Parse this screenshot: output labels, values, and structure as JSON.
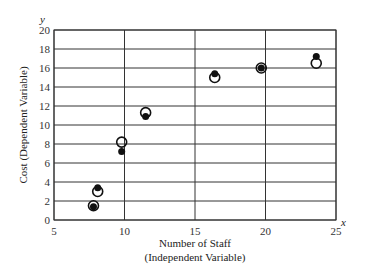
{
  "chart_data": {
    "type": "scatter",
    "title": "",
    "xlabel": "Number of Staff",
    "xlabel_sub": "(Independent Variable)",
    "ylabel": "Cost (Dependent Variable)",
    "x_axis_var": "x",
    "y_axis_var": "y",
    "xlim": [
      5,
      25
    ],
    "ylim": [
      0,
      20
    ],
    "x_ticks": [
      5,
      10,
      15,
      20,
      25
    ],
    "y_ticks": [
      0,
      2,
      4,
      6,
      8,
      10,
      12,
      14,
      16,
      18,
      20
    ],
    "grid": {
      "horizontal_every": 2,
      "vertical_every": 5
    },
    "legend": null,
    "series": [
      {
        "name": "open circles",
        "marker": "open-circle",
        "points": [
          {
            "x": 7.8,
            "y": 1.5
          },
          {
            "x": 8.1,
            "y": 3.0
          },
          {
            "x": 9.8,
            "y": 8.2
          },
          {
            "x": 11.5,
            "y": 11.3
          },
          {
            "x": 16.4,
            "y": 15.0
          },
          {
            "x": 19.7,
            "y": 16.0
          },
          {
            "x": 23.6,
            "y": 16.5
          }
        ]
      },
      {
        "name": "filled dots",
        "marker": "filled-dot",
        "points": [
          {
            "x": 7.8,
            "y": 1.4
          },
          {
            "x": 8.1,
            "y": 3.4
          },
          {
            "x": 9.8,
            "y": 7.2
          },
          {
            "x": 11.5,
            "y": 10.9
          },
          {
            "x": 16.4,
            "y": 15.4
          },
          {
            "x": 19.7,
            "y": 16.0
          },
          {
            "x": 23.6,
            "y": 17.2
          }
        ]
      }
    ]
  },
  "labels": {
    "xlabel": "Number of Staff",
    "xlabel_sub": "(Independent Variable)",
    "ylabel": "Cost (Dependent Variable)",
    "x_var": "x",
    "y_var": "y"
  },
  "colors": {
    "grid": "#333333",
    "marker": "#111111"
  }
}
